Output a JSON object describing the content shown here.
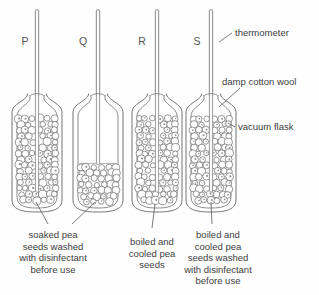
{
  "figure": {
    "title": "",
    "background_color": "#fefefe",
    "line_color": "#6e6e6e",
    "text_color": "#3d3d3d"
  },
  "flasks": [
    {
      "letter": "P",
      "letter_x": 25,
      "letter_y": 45,
      "center_x": 37,
      "fill_level": "full",
      "fill_fraction": 1.0,
      "thermometer": "thermometer-p",
      "caption_ref": "soaked-pea-caption"
    },
    {
      "letter": "Q",
      "letter_x": 83,
      "letter_y": 45,
      "center_x": 98,
      "fill_level": "partial",
      "fill_fraction": 0.45,
      "thermometer": "thermometer-q",
      "caption_ref": "soaked-pea-caption"
    },
    {
      "letter": "R",
      "letter_x": 142,
      "letter_y": 45,
      "center_x": 157,
      "fill_level": "full",
      "fill_fraction": 1.0,
      "thermometer": "thermometer-r",
      "caption_ref": "boiled-cooled-caption"
    },
    {
      "letter": "S",
      "letter_x": 197,
      "letter_y": 45,
      "center_x": 211,
      "fill_level": "full",
      "fill_fraction": 1.0,
      "thermometer": "thermometer-s",
      "caption_ref": "boiled-cooled-washed-caption"
    }
  ],
  "callouts": [
    {
      "id": "thermometer-callout",
      "label": "thermometer",
      "text_x": 235,
      "text_y": 36,
      "leader": "M 232 33 L 219 42"
    },
    {
      "id": "damp-cotton-wool-callout",
      "label": "damp cotton wool",
      "text_x": 222,
      "text_y": 85,
      "leader": "M 240 88 L 219 107"
    },
    {
      "id": "vacuum-flask-callout",
      "label": "vacuum flask",
      "text_x": 238,
      "text_y": 130,
      "leader": "M 235 127 L 228 123"
    }
  ],
  "captions": [
    {
      "id": "soaked-pea-caption",
      "lines": [
        "soaked pea",
        "seeds washed",
        "with disinfectant",
        "before use"
      ],
      "x": 53,
      "y": 238,
      "leaders": [
        "M 36 202 L 48 224",
        "M 95 202 L 72 224"
      ]
    },
    {
      "id": "boiled-cooled-caption",
      "lines": [
        "boiled and",
        "cooled pea",
        "seeds"
      ],
      "x": 152,
      "y": 245,
      "leaders": [
        "M 155 204 L 152 228"
      ]
    },
    {
      "id": "boiled-cooled-washed-caption",
      "lines": [
        "boiled and",
        "cooled pea",
        "seeds washed",
        "with disinfectant",
        "before use"
      ],
      "x": 218,
      "y": 238,
      "leaders": [
        "M 211 202 L 212 224"
      ]
    }
  ]
}
